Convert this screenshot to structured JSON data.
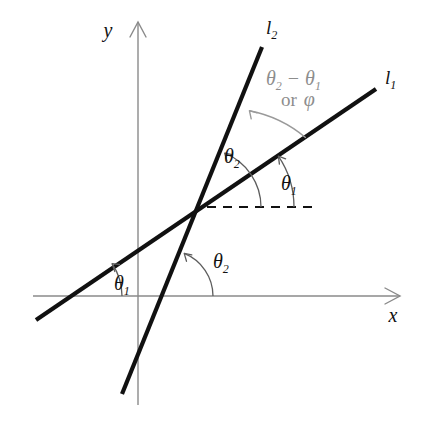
{
  "figure": {
    "kind": "geometry-diagram",
    "title_visible": false,
    "background_color": "#ffffff",
    "width": 426,
    "height": 422
  },
  "colors": {
    "line": "#111111",
    "axis": "#8a8a8a",
    "arc_dark": "#5d5d5d",
    "arc_gray": "#9a9a9a",
    "label_gray": "#8d8d8d",
    "label_dark": "#111111"
  },
  "axes": {
    "x": {
      "label": "x",
      "label_pos": {
        "x": 393,
        "y": 322
      },
      "start": {
        "x": 33,
        "y": 296
      },
      "end": {
        "x": 400,
        "y": 296
      }
    },
    "y": {
      "label": "y",
      "label_pos": {
        "x": 108,
        "y": 37
      },
      "start": {
        "x": 138,
        "y": 405
      },
      "end": {
        "x": 138,
        "y": 22
      }
    }
  },
  "lines": [
    {
      "id": "l1",
      "label": "l",
      "subscript": "1",
      "label_pos": {
        "x": 385,
        "y": 84
      },
      "from": {
        "x": 36,
        "y": 320
      },
      "to": {
        "x": 376,
        "y": 89
      },
      "inclination_symbol": "theta-1"
    },
    {
      "id": "l2",
      "label": "l",
      "subscript": "2",
      "label_pos": {
        "x": 266,
        "y": 34
      },
      "from": {
        "x": 122,
        "y": 394
      },
      "to": {
        "x": 262,
        "y": 47
      },
      "inclination_symbol": "theta-2"
    }
  ],
  "intersection": {
    "x": 203,
    "y": 207
  },
  "dashed_reference": {
    "name": "horizontal-reference",
    "from": {
      "x": 207,
      "y": 207
    },
    "to": {
      "x": 312,
      "y": 207
    }
  },
  "angle_labels": [
    {
      "id": "theta1-at-x-axis",
      "symbol": "θ",
      "subscript": "1",
      "pos": {
        "x": 114,
        "y": 290
      },
      "color": "#111111"
    },
    {
      "id": "theta2-at-x-axis",
      "symbol": "θ",
      "subscript": "2",
      "pos": {
        "x": 213,
        "y": 268
      },
      "color": "#111111"
    },
    {
      "id": "theta2-at-intersection",
      "symbol": "θ",
      "subscript": "2",
      "pos": {
        "x": 224,
        "y": 163
      },
      "color": "#111111"
    },
    {
      "id": "theta1-at-intersection",
      "symbol": "θ",
      "subscript": "1",
      "pos": {
        "x": 281,
        "y": 190
      },
      "color": "#111111"
    }
  ],
  "phi_label": {
    "line1": {
      "theta": "θ",
      "sub_a": "2",
      "minus": "−",
      "theta_b": "θ",
      "sub_b": "1",
      "pos": {
        "x": 266,
        "y": 85
      }
    },
    "line2": {
      "or": "or",
      "phi": "φ",
      "pos": {
        "x": 281,
        "y": 106
      }
    },
    "color": "#8d8d8d"
  },
  "arcs": [
    {
      "id": "arc-theta1-x-axis",
      "center": {
        "x": 64,
        "y": 296
      },
      "radius": 58,
      "start_deg": 0,
      "end_deg": 34,
      "color": "#5d5d5d",
      "arrow_at": "end"
    },
    {
      "id": "arc-theta2-x-axis",
      "center": {
        "x": 167,
        "y": 296
      },
      "radius": 46,
      "start_deg": 0,
      "end_deg": 68,
      "color": "#5d5d5d",
      "arrow_at": "end"
    },
    {
      "id": "arc-theta1-intersection",
      "center": {
        "x": 203,
        "y": 207
      },
      "radius": 91,
      "start_deg": 0,
      "end_deg": 34,
      "color": "#5d5d5d",
      "arrow_at": "end"
    },
    {
      "id": "arc-theta2-intersection",
      "center": {
        "x": 203,
        "y": 207
      },
      "radius": 58,
      "start_deg": 0,
      "end_deg": 68,
      "color": "#5d5d5d",
      "arrow_at": "end"
    },
    {
      "id": "arc-phi-between-lines",
      "center": {
        "x": 203,
        "y": 207
      },
      "radius": 124,
      "start_deg": 34,
      "end_deg": 68,
      "color": "#9a9a9a",
      "arrow_at": "end"
    }
  ]
}
